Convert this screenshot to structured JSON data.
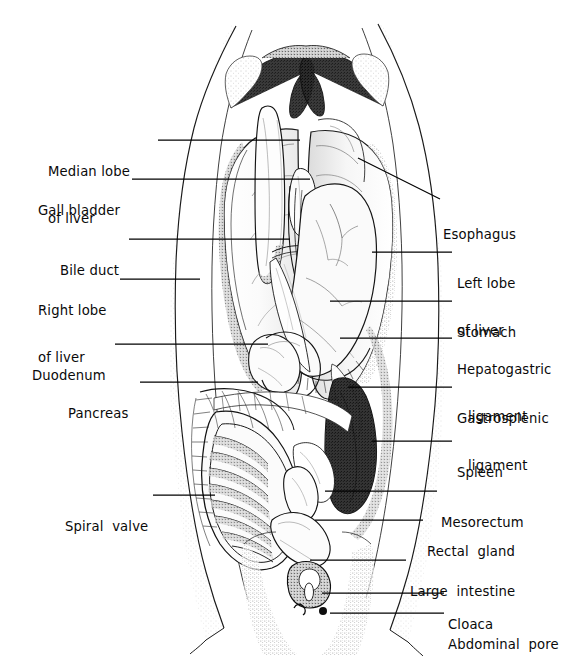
{
  "figure": {
    "background_color": "#ffffff",
    "ink_color": "#111111",
    "line_color": "#000000",
    "stipple_color": "#6b6b6b"
  },
  "labels_left": [
    {
      "id": "median-lobe-of-liver",
      "line1": "Median lobe",
      "line2": "of liver",
      "x": 48,
      "y": 133,
      "leader": {
        "x1": 158,
        "y1": 140,
        "x2": 300,
        "y2": 140
      }
    },
    {
      "id": "gall-bladder",
      "line1": "Gall bladder",
      "line2": "",
      "x": 38,
      "y": 172,
      "leader": {
        "x1": 132,
        "y1": 179,
        "x2": 310,
        "y2": 179
      }
    },
    {
      "id": "bile-duct",
      "line1": "Bile duct",
      "line2": "",
      "x": 60,
      "y": 232,
      "leader": {
        "x1": 129,
        "y1": 239,
        "x2": 290,
        "y2": 239
      }
    },
    {
      "id": "right-lobe-of-liver",
      "line1": "Right lobe",
      "line2": "of liver",
      "x": 38,
      "y": 272,
      "leader": {
        "x1": 120,
        "y1": 279,
        "x2": 200,
        "y2": 279
      }
    },
    {
      "id": "duodenum",
      "line1": "Duodenum",
      "line2": "",
      "x": 32,
      "y": 337,
      "leader": {
        "x1": 115,
        "y1": 344,
        "x2": 268,
        "y2": 344
      }
    },
    {
      "id": "pancreas",
      "line1": "Pancreas",
      "line2": "",
      "x": 68,
      "y": 375,
      "leader": {
        "x1": 140,
        "y1": 382,
        "x2": 258,
        "y2": 382
      }
    },
    {
      "id": "spiral-valve",
      "line1": "Spiral  valve",
      "line2": "",
      "x": 65,
      "y": 488,
      "leader": {
        "x1": 153,
        "y1": 495,
        "x2": 215,
        "y2": 495
      }
    }
  ],
  "labels_right": [
    {
      "id": "esophagus",
      "line1": "Esophagus",
      "line2": "",
      "x": 443,
      "y": 196,
      "leader": {
        "x1": 440,
        "y1": 199,
        "x2": 358,
        "y2": 158
      }
    },
    {
      "id": "left-lobe-of-liver",
      "line1": "Left lobe",
      "line2": "of liver",
      "x": 457,
      "y": 245,
      "leader": {
        "x1": 452,
        "y1": 252,
        "x2": 372,
        "y2": 252
      }
    },
    {
      "id": "stomach",
      "line1": "Stomach",
      "line2": "",
      "x": 457,
      "y": 294,
      "leader": {
        "x1": 452,
        "y1": 301,
        "x2": 330,
        "y2": 301
      }
    },
    {
      "id": "hepatogastric-ligament",
      "line1": "Hepatogastric",
      "line2": "ligament",
      "x": 457,
      "y": 331,
      "leader": {
        "x1": 452,
        "y1": 338,
        "x2": 340,
        "y2": 338
      }
    },
    {
      "id": "gastrosplenic-ligament",
      "line1": "Gastrosplenic",
      "line2": "ligament",
      "x": 457,
      "y": 380,
      "leader": {
        "x1": 452,
        "y1": 387,
        "x2": 348,
        "y2": 387
      }
    },
    {
      "id": "spleen",
      "line1": "Spleen",
      "line2": "",
      "x": 457,
      "y": 434,
      "leader": {
        "x1": 452,
        "y1": 441,
        "x2": 372,
        "y2": 441
      }
    },
    {
      "id": "mesorectum",
      "line1": "Mesorectum",
      "line2": "",
      "x": 441,
      "y": 484,
      "leader": {
        "x1": 437,
        "y1": 491,
        "x2": 325,
        "y2": 491
      }
    },
    {
      "id": "rectal-gland",
      "line1": "Rectal  gland",
      "line2": "",
      "x": 427,
      "y": 513,
      "leader": {
        "x1": 423,
        "y1": 520,
        "x2": 315,
        "y2": 520
      }
    },
    {
      "id": "large-intestine",
      "line1": "Large  intestine",
      "line2": "",
      "x": 410,
      "y": 553,
      "leader": {
        "x1": 406,
        "y1": 560,
        "x2": 310,
        "y2": 560
      }
    },
    {
      "id": "cloaca",
      "line1": "Cloaca",
      "line2": "",
      "x": 448,
      "y": 586,
      "leader": {
        "x1": 444,
        "y1": 593,
        "x2": 322,
        "y2": 593
      }
    },
    {
      "id": "abdominal-pore",
      "line1": "Abdominal  pore",
      "line2": "",
      "x": 448,
      "y": 606,
      "leader": {
        "x1": 444,
        "y1": 613,
        "x2": 330,
        "y2": 613
      }
    }
  ],
  "structures": [
    {
      "id": "body-wall-left",
      "name": "left body wall flap"
    },
    {
      "id": "body-wall-right",
      "name": "right body wall flap"
    },
    {
      "id": "pectoral-girdle",
      "name": "pectoral girdle arch"
    },
    {
      "id": "median-lobe-liver",
      "name": "median lobe of liver"
    },
    {
      "id": "left-lobe-liver",
      "name": "left lobe of liver"
    },
    {
      "id": "right-lobe-liver",
      "name": "right lobe of liver"
    },
    {
      "id": "gall-bladder-sac",
      "name": "gall bladder"
    },
    {
      "id": "bile-duct-strand",
      "name": "bile duct"
    },
    {
      "id": "esophagus-tube",
      "name": "esophagus"
    },
    {
      "id": "stomach-body",
      "name": "stomach"
    },
    {
      "id": "duodenum-loop",
      "name": "duodenum"
    },
    {
      "id": "pancreas-body",
      "name": "pancreas"
    },
    {
      "id": "spleen-body",
      "name": "spleen"
    },
    {
      "id": "spiral-valve-intestine",
      "name": "spiral valve intestine"
    },
    {
      "id": "rectal-gland-finger",
      "name": "rectal gland"
    },
    {
      "id": "large-intestine-tube",
      "name": "large intestine"
    },
    {
      "id": "cloaca-opening",
      "name": "cloaca"
    },
    {
      "id": "abdominal-pore-opening",
      "name": "abdominal pore"
    },
    {
      "id": "mesorectum-membrane",
      "name": "mesorectum"
    },
    {
      "id": "hepatogastric-ligament-sheet",
      "name": "hepatogastric ligament"
    },
    {
      "id": "gastrosplenic-ligament-sheet",
      "name": "gastrosplenic ligament"
    }
  ]
}
